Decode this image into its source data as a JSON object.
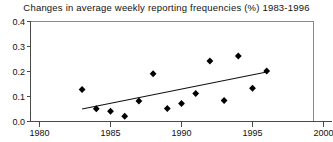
{
  "chart_data": {
    "type": "scatter",
    "title": "Changes in average weekly reporting frequencies (%) 1983-1996",
    "xlabel": "",
    "ylabel": "",
    "xlim": [
      1980,
      2000
    ],
    "ylim": [
      0.0,
      0.4
    ],
    "xticks": [
      "1980",
      "1985",
      "1990",
      "1995",
      "2000"
    ],
    "xtick_values": [
      1980,
      1985,
      1990,
      1995,
      2000
    ],
    "yticks": [
      "0.0",
      "0.1",
      "0.2",
      "0.3",
      "0.4"
    ],
    "ytick_values": [
      0.0,
      0.1,
      0.2,
      0.3,
      0.4
    ],
    "grid": false,
    "legend": "none",
    "x": [
      1983,
      1984,
      1985,
      1986,
      1987,
      1988,
      1989,
      1990,
      1991,
      1992,
      1993,
      1994,
      1995,
      1996
    ],
    "values": [
      0.128,
      0.051,
      0.041,
      0.021,
      0.082,
      0.191,
      0.052,
      0.072,
      0.112,
      0.242,
      0.084,
      0.262,
      0.133,
      0.202
    ],
    "series": [
      {
        "name": "Change in average weekly reporting frequency",
        "marker": "diamond",
        "color": "#000000",
        "points": [
          {
            "x": 1983,
            "y": 0.128
          },
          {
            "x": 1984,
            "y": 0.051
          },
          {
            "x": 1985,
            "y": 0.041
          },
          {
            "x": 1986,
            "y": 0.021
          },
          {
            "x": 1987,
            "y": 0.082
          },
          {
            "x": 1988,
            "y": 0.191
          },
          {
            "x": 1989,
            "y": 0.052
          },
          {
            "x": 1990,
            "y": 0.072
          },
          {
            "x": 1991,
            "y": 0.112
          },
          {
            "x": 1992,
            "y": 0.242
          },
          {
            "x": 1993,
            "y": 0.084
          },
          {
            "x": 1994,
            "y": 0.262
          },
          {
            "x": 1995,
            "y": 0.133
          },
          {
            "x": 1996,
            "y": 0.202
          }
        ]
      },
      {
        "name": "Linear trend",
        "type": "line",
        "color": "#111111",
        "points": [
          {
            "x": 1983,
            "y": 0.05
          },
          {
            "x": 1996,
            "y": 0.198
          }
        ]
      }
    ],
    "annotations": []
  },
  "colors": {
    "background": "#ffffff",
    "marker": "#000000",
    "trend": "#111111",
    "axis": "#4a4a4a",
    "frame": "#8a8a8a",
    "text": "#111111"
  }
}
